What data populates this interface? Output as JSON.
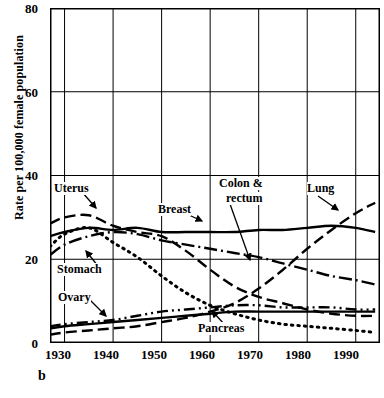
{
  "panel": {
    "letter": "b"
  },
  "axes": {
    "ylabel": "Rate per 100,000 female population",
    "yticks": [
      "80",
      "60",
      "40",
      "20",
      "0"
    ],
    "xticks": [
      "1930",
      "1940",
      "1950",
      "1960",
      "1970",
      "1980",
      "1990"
    ]
  },
  "annotations": {
    "uterus": "Uterus",
    "stomach": "Stomach",
    "ovary": "Ovary",
    "breast": "Breast",
    "colon_rectum": "Colon &\nrectum",
    "colon_line1": "Colon &",
    "colon_line2": "rectum",
    "lung": "Lung",
    "pancreas": "Pancreas"
  },
  "chart_data": {
    "type": "line",
    "title": "",
    "xlabel": "",
    "ylabel": "Rate per 100,000 female population",
    "xlim": [
      1927,
      1995
    ],
    "ylim": [
      0,
      80
    ],
    "grid": true,
    "legend": "inline-annotations",
    "xticks": [
      1930,
      1940,
      1950,
      1960,
      1970,
      1980,
      1990
    ],
    "yticks": [
      0,
      20,
      40,
      60,
      80
    ],
    "series": [
      {
        "name": "Uterus",
        "linestyle": "dashed",
        "x": [
          1927,
          1930,
          1935,
          1940,
          1945,
          1950,
          1955,
          1960,
          1965,
          1970,
          1975,
          1980,
          1985,
          1990,
          1994
        ],
        "values": [
          28.5,
          30.0,
          30.5,
          28.0,
          26.5,
          25.5,
          22.0,
          17.5,
          13.5,
          11.0,
          9.5,
          8.0,
          7.0,
          6.5,
          6.5
        ]
      },
      {
        "name": "Breast",
        "linestyle": "solid",
        "x": [
          1927,
          1930,
          1935,
          1940,
          1945,
          1950,
          1955,
          1960,
          1965,
          1970,
          1975,
          1980,
          1985,
          1990,
          1994
        ],
        "values": [
          25.5,
          26.5,
          27.5,
          27.0,
          27.5,
          26.5,
          26.5,
          26.5,
          26.5,
          27.0,
          27.0,
          27.5,
          28.0,
          27.5,
          26.5
        ]
      },
      {
        "name": "Stomach",
        "linestyle": "dotted",
        "x": [
          1927,
          1930,
          1935,
          1940,
          1945,
          1950,
          1955,
          1960,
          1965,
          1970,
          1975,
          1980,
          1985,
          1990,
          1994
        ],
        "values": [
          23.0,
          26.0,
          27.5,
          24.0,
          20.5,
          16.0,
          12.0,
          9.0,
          7.0,
          5.5,
          4.5,
          4.0,
          3.5,
          3.0,
          2.5
        ]
      },
      {
        "name": "Colon & rectum",
        "linestyle": "dash-dot",
        "x": [
          1927,
          1930,
          1935,
          1940,
          1945,
          1950,
          1955,
          1960,
          1965,
          1970,
          1975,
          1980,
          1985,
          1990,
          1994
        ],
        "values": [
          21.0,
          23.5,
          25.5,
          26.5,
          26.0,
          24.5,
          23.5,
          22.5,
          21.5,
          20.5,
          19.0,
          17.5,
          16.0,
          15.0,
          14.0
        ]
      },
      {
        "name": "Ovary",
        "linestyle": "dash-dot-dot",
        "x": [
          1927,
          1930,
          1935,
          1940,
          1945,
          1950,
          1955,
          1960,
          1965,
          1970,
          1975,
          1980,
          1985,
          1990,
          1994
        ],
        "values": [
          4.0,
          4.5,
          5.0,
          5.5,
          6.5,
          7.5,
          8.0,
          8.5,
          9.0,
          9.0,
          8.5,
          8.5,
          8.5,
          8.0,
          8.0
        ]
      },
      {
        "name": "Pancreas",
        "linestyle": "solid",
        "x": [
          1927,
          1930,
          1935,
          1940,
          1945,
          1950,
          1955,
          1960,
          1965,
          1970,
          1975,
          1980,
          1985,
          1990,
          1994
        ],
        "values": [
          3.5,
          4.0,
          4.5,
          5.0,
          5.5,
          6.0,
          6.5,
          7.0,
          7.5,
          7.5,
          7.5,
          7.5,
          7.5,
          7.5,
          7.5
        ]
      },
      {
        "name": "Lung",
        "linestyle": "dashed",
        "x": [
          1927,
          1930,
          1935,
          1940,
          1945,
          1950,
          1955,
          1960,
          1965,
          1970,
          1975,
          1980,
          1985,
          1990,
          1994
        ],
        "values": [
          2.0,
          2.5,
          3.0,
          3.5,
          4.0,
          5.0,
          6.0,
          7.5,
          9.5,
          13.0,
          17.5,
          22.5,
          27.0,
          31.0,
          33.5
        ]
      }
    ]
  }
}
